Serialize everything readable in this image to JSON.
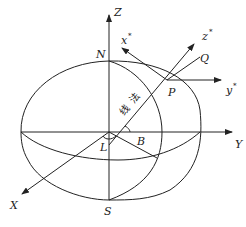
{
  "diagram": {
    "type": "geodetic-coordinate-ellipsoid",
    "axes": {
      "Z": "Z",
      "Y": "Y",
      "X": "X"
    },
    "local_axes": {
      "x_star": "x",
      "y_star": "y",
      "z_star": "z",
      "star": "*"
    },
    "points": {
      "N": "N",
      "S": "S",
      "P": "P",
      "Q": "Q",
      "L": "L",
      "B": "B"
    },
    "normal_label": [
      "法",
      "线"
    ],
    "colors": {
      "line": "#222222",
      "background": "#ffffff"
    }
  }
}
